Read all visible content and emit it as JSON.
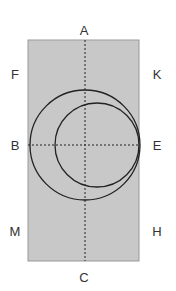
{
  "diagram": {
    "width": 176,
    "height": 291,
    "colors": {
      "background": "#ffffff",
      "rect_fill": "#c8c8c8",
      "rect_stroke": "#999999",
      "line": "#222222",
      "label": "#333333"
    },
    "rectangle": {
      "x": 28,
      "y": 40,
      "width": 111,
      "height": 221
    },
    "axes": {
      "vertical": {
        "x": 85,
        "y1": 40,
        "y2": 261,
        "style": "dashed"
      },
      "horizontal": {
        "y": 145,
        "x1": 28,
        "x2": 139,
        "style": "dashed"
      }
    },
    "circles": [
      {
        "name": "large-circle",
        "cx": 85,
        "cy": 145,
        "r": 55
      },
      {
        "name": "small-circle",
        "cx": 97,
        "cy": 145,
        "r": 42
      }
    ],
    "labels": [
      {
        "id": "A",
        "text": "A",
        "x": 84,
        "y": 35
      },
      {
        "id": "C",
        "text": "C",
        "x": 84,
        "y": 282
      },
      {
        "id": "B",
        "text": "B",
        "x": 15,
        "y": 150
      },
      {
        "id": "E",
        "text": "E",
        "x": 157,
        "y": 150
      },
      {
        "id": "F",
        "text": "F",
        "x": 15,
        "y": 79
      },
      {
        "id": "K",
        "text": "K",
        "x": 157,
        "y": 79
      },
      {
        "id": "M",
        "text": "M",
        "x": 15,
        "y": 236
      },
      {
        "id": "H",
        "text": "H",
        "x": 157,
        "y": 236
      }
    ]
  }
}
